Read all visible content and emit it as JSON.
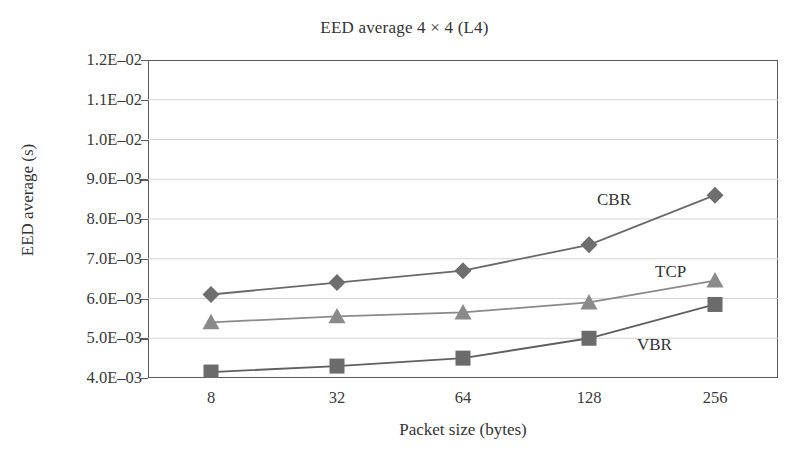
{
  "chart_data": {
    "type": "line",
    "title": "EED average 4 × 4 (L4)",
    "xlabel": "Packet size (bytes)",
    "ylabel": "EED average (s)",
    "categories": [
      "8",
      "32",
      "64",
      "128",
      "256"
    ],
    "x": [
      8,
      32,
      64,
      128,
      256
    ],
    "ylim": [
      0.004,
      0.012
    ],
    "ytick_values": [
      0.004,
      0.005,
      0.006,
      0.007,
      0.008,
      0.009,
      0.01,
      0.011,
      0.012
    ],
    "ytick_labels": [
      "4.0E–03",
      "5.0E–03",
      "6.0E–03",
      "7.0E–03",
      "8.0E–03",
      "9.0E–03",
      "1.0E–02",
      "1.1E–02",
      "1.2E–02"
    ],
    "grid": "horizontal",
    "legend_position": "inline-annotations",
    "series": [
      {
        "name": "CBR",
        "marker": "diamond",
        "color": "#6e6e6e",
        "line_color": "#6a6a6a",
        "values": [
          0.0061,
          0.0064,
          0.0067,
          0.00735,
          0.0086
        ]
      },
      {
        "name": "TCP",
        "marker": "triangle",
        "color": "#8a8a8a",
        "line_color": "#8a8a8a",
        "values": [
          0.0054,
          0.00555,
          0.00565,
          0.0059,
          0.00645
        ]
      },
      {
        "name": "VBR",
        "marker": "square",
        "color": "#6b6b6b",
        "line_color": "#5f5f5f",
        "values": [
          0.00415,
          0.0043,
          0.0045,
          0.005,
          0.00585
        ]
      }
    ],
    "annotations": [
      {
        "text": "CBR",
        "x_px": 597,
        "y_px": 190
      },
      {
        "text": "TCP",
        "x_px": 655,
        "y_px": 262
      },
      {
        "text": "VBR",
        "x_px": 637,
        "y_px": 335
      }
    ],
    "colors": {
      "axis": "#5a5a5a",
      "grid": "#d4d4d4",
      "text": "#333333",
      "background": "#ffffff"
    }
  }
}
